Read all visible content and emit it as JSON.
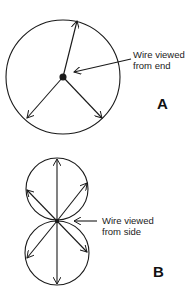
{
  "figure_a": {
    "label": "A",
    "annotation_line1": "Wire viewed",
    "annotation_line2": "from end"
  },
  "figure_b": {
    "label": "B",
    "annotation_line1": "Wire viewed",
    "annotation_line2": "from side"
  },
  "colors": {
    "stroke": "#1a1a1a",
    "background": "#ffffff"
  }
}
